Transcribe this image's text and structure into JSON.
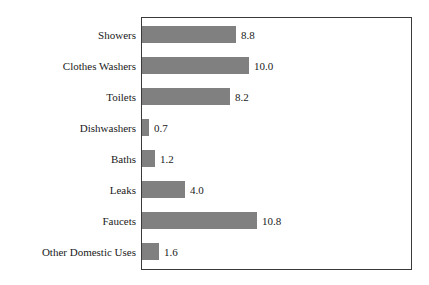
{
  "chart_data": {
    "type": "bar",
    "orientation": "horizontal",
    "title": "",
    "subtitle": "",
    "xlabel": "",
    "ylabel": "",
    "grid": false,
    "legend": null,
    "xlim": [
      0,
      25.3
    ],
    "categories": [
      "Showers",
      "Clothes Washers",
      "Toilets",
      "Dishwashers",
      "Baths",
      "Leaks",
      "Faucets",
      "Other Domestic Uses"
    ],
    "values": [
      8.8,
      10.0,
      8.2,
      0.7,
      1.2,
      4.0,
      10.8,
      1.6
    ],
    "value_labels": [
      "8.8",
      "10.0",
      "8.2",
      "0.7",
      "1.2",
      "4.0",
      "10.8",
      "1.6"
    ],
    "bars": [
      {
        "label": "Showers",
        "value": 8.8,
        "value_label": "8.8"
      },
      {
        "label": "Clothes Washers",
        "value": 10.0,
        "value_label": "10.0"
      },
      {
        "label": "Toilets",
        "value": 8.2,
        "value_label": "8.2"
      },
      {
        "label": "Dishwashers",
        "value": 0.7,
        "value_label": "0.7"
      },
      {
        "label": "Baths",
        "value": 1.2,
        "value_label": "1.2"
      },
      {
        "label": "Leaks",
        "value": 4.0,
        "value_label": "4.0"
      },
      {
        "label": "Faucets",
        "value": 10.8,
        "value_label": "10.8"
      },
      {
        "label": "Other Domestic Uses",
        "value": 1.6,
        "value_label": "1.6"
      }
    ],
    "colors": {
      "bar_fill": "#808080",
      "plot_border": "#3a3a3a",
      "background": "#ffffff",
      "text": "#1a1a1a"
    }
  }
}
